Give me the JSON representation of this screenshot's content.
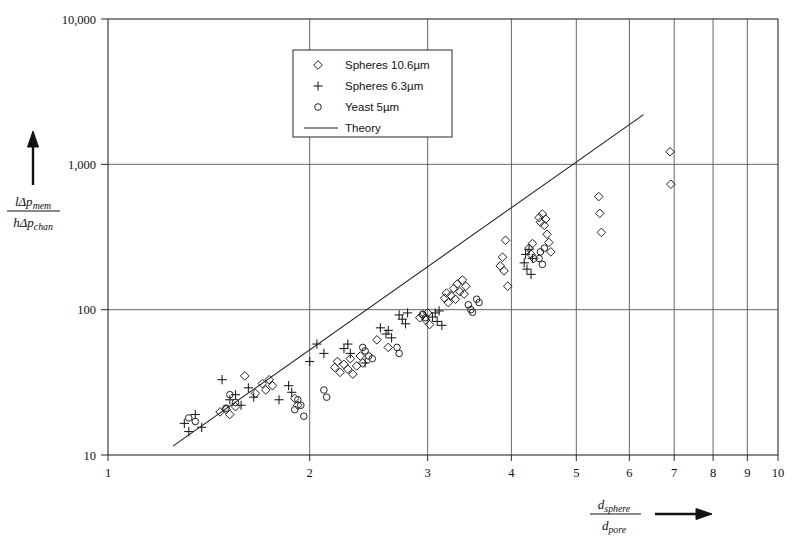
{
  "chart_data": {
    "type": "scatter",
    "title": "",
    "xlabel": "d_sphere / d_pore",
    "ylabel": "l*delta_p_mem / h*delta_p_chan",
    "xscale": "log",
    "yscale": "log",
    "xlim": [
      1,
      10
    ],
    "ylim": [
      10,
      10000
    ],
    "xticks": [
      1,
      2,
      3,
      4,
      5,
      6,
      7,
      8,
      9,
      10
    ],
    "xtick_labels": [
      "1",
      "2",
      "3",
      "4",
      "5",
      "6",
      "7",
      "8",
      "9",
      "10"
    ],
    "yticks": [
      10,
      100,
      1000,
      10000
    ],
    "ytick_labels": [
      "10",
      "100",
      "1,000",
      "10,000"
    ],
    "grid": "vertical-major",
    "legend_position": "top-center",
    "axis_label_x_parts": {
      "numerator": "d",
      "numerator_sub": "sphere",
      "denominator": "d",
      "denominator_sub": "pore"
    },
    "axis_label_y_parts": {
      "numerator": "lΔp",
      "numerator_sub": "mem",
      "denominator": "hΔp",
      "denominator_sub": "chan"
    },
    "series": [
      {
        "name": "Spheres 10.6µm",
        "marker": "diamond",
        "points": [
          [
            1.47,
            19.8
          ],
          [
            1.5,
            20.6
          ],
          [
            1.52,
            19.0
          ],
          [
            1.55,
            21.5
          ],
          [
            1.6,
            35.0
          ],
          [
            1.66,
            26.5
          ],
          [
            1.7,
            31.0
          ],
          [
            1.72,
            28.0
          ],
          [
            1.74,
            33.0
          ],
          [
            1.76,
            30.0
          ],
          [
            1.9,
            24.5
          ],
          [
            1.92,
            22.0
          ],
          [
            2.18,
            40.0
          ],
          [
            2.2,
            44.0
          ],
          [
            2.22,
            37.0
          ],
          [
            2.25,
            42.0
          ],
          [
            2.28,
            39.0
          ],
          [
            2.3,
            46.0
          ],
          [
            2.32,
            36.0
          ],
          [
            2.35,
            41.0
          ],
          [
            2.38,
            48.0
          ],
          [
            2.4,
            43.0
          ],
          [
            2.52,
            62.0
          ],
          [
            2.62,
            55.0
          ],
          [
            2.92,
            88.0
          ],
          [
            2.95,
            92.0
          ],
          [
            2.98,
            85.0
          ],
          [
            3.0,
            95.0
          ],
          [
            3.02,
            79.0
          ],
          [
            3.18,
            120.0
          ],
          [
            3.2,
            130.0
          ],
          [
            3.22,
            112.0
          ],
          [
            3.25,
            125.0
          ],
          [
            3.28,
            140.0
          ],
          [
            3.3,
            118.0
          ],
          [
            3.32,
            150.0
          ],
          [
            3.35,
            133.0
          ],
          [
            3.38,
            160.0
          ],
          [
            3.4,
            128.0
          ],
          [
            3.42,
            145.0
          ],
          [
            3.85,
            200.0
          ],
          [
            3.88,
            230.0
          ],
          [
            3.9,
            185.0
          ],
          [
            3.92,
            300.0
          ],
          [
            3.95,
            145.0
          ],
          [
            4.25,
            265.0
          ],
          [
            4.28,
            240.0
          ],
          [
            4.3,
            285.0
          ],
          [
            4.32,
            225.0
          ],
          [
            4.4,
            430.0
          ],
          [
            4.42,
            400.0
          ],
          [
            4.45,
            455.0
          ],
          [
            4.48,
            380.0
          ],
          [
            4.5,
            420.0
          ],
          [
            4.52,
            330.0
          ],
          [
            4.55,
            290.0
          ],
          [
            4.58,
            250.0
          ],
          [
            5.4,
            600.0
          ],
          [
            5.42,
            460.0
          ],
          [
            5.45,
            340.0
          ],
          [
            6.9,
            1220.0
          ],
          [
            6.92,
            730.0
          ]
        ]
      },
      {
        "name": "Spheres 6.3µm",
        "marker": "plus",
        "points": [
          [
            1.3,
            16.5
          ],
          [
            1.32,
            14.5
          ],
          [
            1.35,
            19.0
          ],
          [
            1.38,
            15.5
          ],
          [
            1.48,
            33.0
          ],
          [
            1.52,
            24.0
          ],
          [
            1.55,
            26.0
          ],
          [
            1.58,
            22.0
          ],
          [
            1.62,
            29.0
          ],
          [
            1.65,
            25.0
          ],
          [
            1.8,
            24.0
          ],
          [
            1.86,
            30.0
          ],
          [
            1.88,
            27.0
          ],
          [
            2.0,
            44.0
          ],
          [
            2.05,
            58.0
          ],
          [
            2.1,
            50.0
          ],
          [
            2.25,
            54.0
          ],
          [
            2.28,
            58.0
          ],
          [
            2.3,
            50.0
          ],
          [
            2.42,
            43.0
          ],
          [
            2.55,
            75.0
          ],
          [
            2.6,
            68.0
          ],
          [
            2.62,
            72.0
          ],
          [
            2.65,
            64.0
          ],
          [
            2.72,
            92.0
          ],
          [
            2.75,
            86.0
          ],
          [
            2.78,
            80.0
          ],
          [
            2.8,
            95.0
          ],
          [
            3.05,
            89.0
          ],
          [
            3.08,
            95.0
          ],
          [
            3.1,
            83.0
          ],
          [
            3.12,
            98.0
          ],
          [
            3.15,
            78.0
          ],
          [
            4.18,
            210.0
          ],
          [
            4.2,
            240.0
          ],
          [
            4.22,
            190.0
          ],
          [
            4.25,
            260.0
          ],
          [
            4.28,
            175.0
          ],
          [
            4.3,
            225.0
          ]
        ]
      },
      {
        "name": "Yeast 5µm",
        "marker": "circle",
        "points": [
          [
            1.32,
            18.0
          ],
          [
            1.35,
            17.0
          ],
          [
            1.5,
            21.0
          ],
          [
            1.52,
            26.0
          ],
          [
            1.55,
            23.0
          ],
          [
            1.9,
            20.5
          ],
          [
            1.92,
            24.0
          ],
          [
            1.94,
            22.0
          ],
          [
            1.96,
            18.5
          ],
          [
            2.1,
            28.0
          ],
          [
            2.12,
            25.0
          ],
          [
            2.4,
            55.0
          ],
          [
            2.42,
            52.0
          ],
          [
            2.45,
            48.0
          ],
          [
            2.48,
            46.0
          ],
          [
            2.7,
            55.0
          ],
          [
            2.72,
            50.0
          ],
          [
            2.95,
            93.0
          ],
          [
            2.98,
            88.0
          ],
          [
            3.45,
            108.0
          ],
          [
            3.48,
            100.0
          ],
          [
            3.5,
            96.0
          ],
          [
            3.55,
            118.0
          ],
          [
            3.58,
            112.0
          ],
          [
            4.4,
            225.0
          ],
          [
            4.42,
            250.0
          ],
          [
            4.45,
            205.0
          ],
          [
            4.48,
            265.0
          ]
        ]
      }
    ],
    "theory": {
      "name": "Theory",
      "line_points": [
        [
          1.25,
          11.5
        ],
        [
          6.3,
          2200
        ]
      ]
    },
    "legend": {
      "entries": [
        {
          "label": "Spheres 10.6µm",
          "marker": "diamond"
        },
        {
          "label": "Spheres 6.3µm",
          "marker": "plus"
        },
        {
          "label": "Yeast 5µm",
          "marker": "circle"
        },
        {
          "label": "Theory",
          "marker": "line"
        }
      ]
    }
  }
}
